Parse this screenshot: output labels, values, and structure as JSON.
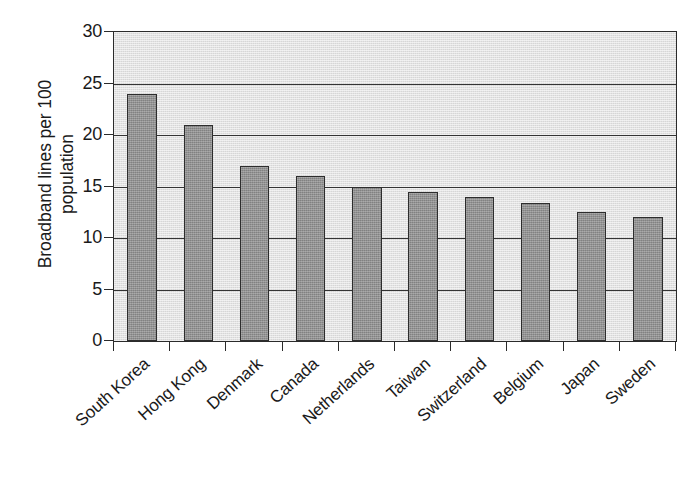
{
  "chart_data": {
    "type": "bar",
    "title": "",
    "xlabel": "",
    "ylabel_line1": "Broadband lines per 100",
    "ylabel_line2": "population",
    "categories": [
      "South Korea",
      "Hong Kong",
      "Denmark",
      "Canada",
      "Netherlands",
      "Taiwan",
      "Switzerland",
      "Belgium",
      "Japan",
      "Sweden"
    ],
    "values": [
      24,
      21,
      17,
      16,
      15,
      14.5,
      14,
      13.4,
      12.5,
      12
    ],
    "ylim": [
      0,
      30
    ],
    "yticks": [
      0,
      5,
      10,
      15,
      20,
      25,
      30
    ],
    "ytick_labels": [
      "0",
      "5",
      "10",
      "15",
      "20",
      "25",
      "30"
    ],
    "grid": true,
    "grid_axis": "y",
    "legend": false,
    "legend_position": "none",
    "bar_color": "#8e8e8e",
    "bar_edge_color": "#2d2d2d",
    "plot_background": "#d6d6d6",
    "axis_color": "#2b2b2b",
    "text_color": "#1a1a1a",
    "xtick_label_rotation": -42
  }
}
